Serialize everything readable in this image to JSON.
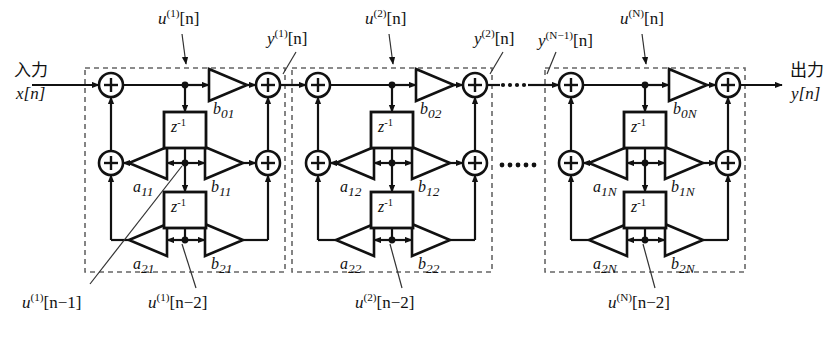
{
  "figure": {
    "type": "signal-flow-diagram",
    "line_color": "#111111",
    "dash_color": "#666666",
    "background": "#ffffff"
  },
  "io": {
    "input_jp": "入力",
    "input_signal": "x[n]",
    "output_jp": "出力",
    "output_signal": "y[n]"
  },
  "ellipsis": {
    "top": "·····",
    "middle": "·····"
  },
  "sections": [
    {
      "id": "section-1",
      "index": "1",
      "node_label": "u",
      "node_sup": "(1)",
      "node_arg": "[n]",
      "out_label": "y",
      "out_sup": "(1)",
      "out_arg": "[n]",
      "delay1": "z",
      "delay1_sup": "-1",
      "delay2": "z",
      "delay2_sup": "-1",
      "coef_b0": "b",
      "coef_b0_sub": "01",
      "coef_b1": "b",
      "coef_b1_sub": "11",
      "coef_b2": "b",
      "coef_b2_sub": "21",
      "coef_a1": "a",
      "coef_a1_sub": "11",
      "coef_a2": "a",
      "coef_a2_sub": "21",
      "state1": "u",
      "state1_sup": "(1)",
      "state1_arg": "[n−1]",
      "state2": "u",
      "state2_sup": "(1)",
      "state2_arg": "[n−2]"
    },
    {
      "id": "section-2",
      "index": "2",
      "node_label": "u",
      "node_sup": "(2)",
      "node_arg": "[n]",
      "out_label": "y",
      "out_sup": "(2)",
      "out_arg": "[n]",
      "delay1": "z",
      "delay1_sup": "-1",
      "delay2": "z",
      "delay2_sup": "-1",
      "coef_b0": "b",
      "coef_b0_sub": "02",
      "coef_b1": "b",
      "coef_b1_sub": "12",
      "coef_b2": "b",
      "coef_b2_sub": "22",
      "coef_a1": "a",
      "coef_a1_sub": "12",
      "coef_a2": "a",
      "coef_a2_sub": "22",
      "state2": "u",
      "state2_sup": "(2)",
      "state2_arg": "[n−2]"
    },
    {
      "id": "section-N",
      "index": "N",
      "node_label": "u",
      "node_sup": "(N)",
      "node_arg": "[n]",
      "in_label": "y",
      "in_sup": "(N−1)",
      "in_arg": "[n]",
      "delay1": "z",
      "delay1_sup": "-1",
      "delay2": "z",
      "delay2_sup": "-1",
      "coef_b0": "b",
      "coef_b0_sub": "0N",
      "coef_b1": "b",
      "coef_b1_sub": "1N",
      "coef_b2": "b",
      "coef_b2_sub": "2N",
      "coef_a1": "a",
      "coef_a1_sub": "1N",
      "coef_a2": "a",
      "coef_a2_sub": "2N",
      "state2": "u",
      "state2_sup": "(N)",
      "state2_arg": "[n−2]"
    }
  ],
  "adder_symbol": "+"
}
